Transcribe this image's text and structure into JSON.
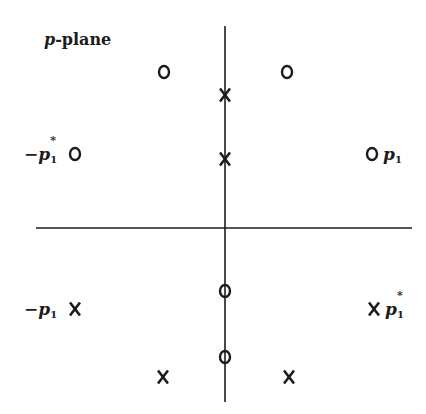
{
  "title": {
    "italic": "p",
    "rest": "-plane"
  },
  "colors": {
    "ink": "#1c1c1c",
    "background": "#ffffff"
  },
  "axes": {
    "horizontal": {
      "x1": 36,
      "x2": 412,
      "y": 228
    },
    "vertical": {
      "x": 225,
      "y1": 26,
      "y2": 402
    }
  },
  "markers": {
    "zeros": [
      {
        "name": "zero-upper-left",
        "x": 164,
        "y": 72
      },
      {
        "name": "zero-upper-right",
        "x": 287,
        "y": 72
      },
      {
        "name": "zero-neg-p1-conj",
        "x": 75,
        "y": 154
      },
      {
        "name": "zero-p1",
        "x": 372,
        "y": 154
      },
      {
        "name": "zero-axis-upper",
        "x": 225,
        "y": 291
      },
      {
        "name": "zero-axis-lower",
        "x": 225,
        "y": 357
      }
    ],
    "poles": [
      {
        "name": "pole-axis-upper",
        "x": 225,
        "y": 95
      },
      {
        "name": "pole-axis-lower",
        "x": 225,
        "y": 159
      },
      {
        "name": "pole-neg-p1",
        "x": 75,
        "y": 309
      },
      {
        "name": "pole-p1-conj",
        "x": 374,
        "y": 309
      },
      {
        "name": "pole-lower-left",
        "x": 163,
        "y": 377
      },
      {
        "name": "pole-lower-right",
        "x": 289,
        "y": 377
      }
    ]
  },
  "labels": {
    "neg_p1_conj": {
      "sign": "−",
      "var": "p",
      "sub": "1",
      "sup": "*"
    },
    "p1": {
      "var": "p",
      "sub": "1"
    },
    "neg_p1": {
      "sign": "−",
      "var": "p",
      "sub": "1"
    },
    "p1_conj": {
      "var": "p",
      "sub": "1",
      "sup": "*"
    }
  }
}
